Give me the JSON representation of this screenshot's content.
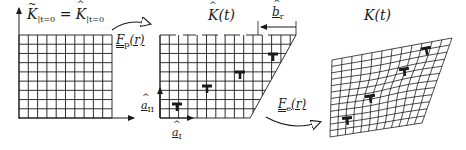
{
  "diagram": {
    "type": "multiplicative-decomposition-kinematics",
    "panels": [
      {
        "id": "reference",
        "label_lhs": "K",
        "label_lhs_sub": "|t=0",
        "label_eq": "=",
        "label_rhs": "K",
        "label_rhs_sub": "|t=0",
        "description": "undeformed square lattice with axes"
      },
      {
        "id": "intermediate",
        "label": "K(t)",
        "description": "plastically sheared lattice with edge dislocations",
        "burgers_label": "b",
        "burgers_sub": "r",
        "axis_1_label": "a",
        "axis_1_sub": "I",
        "axis_2_label": "a",
        "axis_2_sub": "II",
        "dislocation_count": 4
      },
      {
        "id": "current",
        "label": "K(t)",
        "description": "elastically distorted lattice",
        "dislocation_count": 4
      }
    ],
    "maps": [
      {
        "id": "plastic",
        "label": "F",
        "sub": "p",
        "arg": "(r)"
      },
      {
        "id": "elastic",
        "label": "F",
        "sub": "e",
        "arg": "(r)"
      }
    ]
  },
  "colors": {
    "line": "#1a1a1a",
    "background": "#ffffff"
  }
}
